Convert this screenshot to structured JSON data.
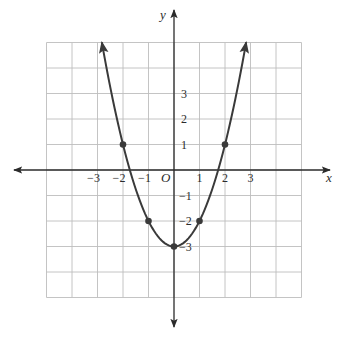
{
  "chart_data": {
    "type": "line",
    "title": "",
    "function": "y = x^2 - 3",
    "xlabel": "x",
    "ylabel": "y",
    "origin_label": "O",
    "xlim": [
      -6,
      6
    ],
    "ylim": [
      -6,
      6
    ],
    "grid": true,
    "grid_range": {
      "x": [
        -5,
        5
      ],
      "y": [
        -5,
        5
      ]
    },
    "x_ticks": [
      {
        "value": -3,
        "label": "−3"
      },
      {
        "value": -2,
        "label": "−2"
      },
      {
        "value": -1,
        "label": "−1"
      },
      {
        "value": 1,
        "label": "1"
      },
      {
        "value": 2,
        "label": "2"
      },
      {
        "value": 3,
        "label": "3"
      }
    ],
    "y_ticks": [
      {
        "value": 3,
        "label": "3"
      },
      {
        "value": 2,
        "label": "2"
      },
      {
        "value": 1,
        "label": "1"
      },
      {
        "value": -1,
        "label": "−1"
      },
      {
        "value": -2,
        "label": "−2"
      },
      {
        "value": -3,
        "label": "−3"
      }
    ],
    "series": [
      {
        "name": "parabola",
        "curve_x_range": [
          -2.83,
          2.83
        ],
        "arrow_ends": true,
        "points": [
          {
            "x": -2,
            "y": 1
          },
          {
            "x": -1,
            "y": -2
          },
          {
            "x": 0,
            "y": -3
          },
          {
            "x": 1,
            "y": -2
          },
          {
            "x": 2,
            "y": 1
          }
        ]
      }
    ],
    "colors": {
      "curve": "#3a3a3a",
      "grid": "#bdbdbd",
      "axis": "#2b2b2b"
    }
  }
}
